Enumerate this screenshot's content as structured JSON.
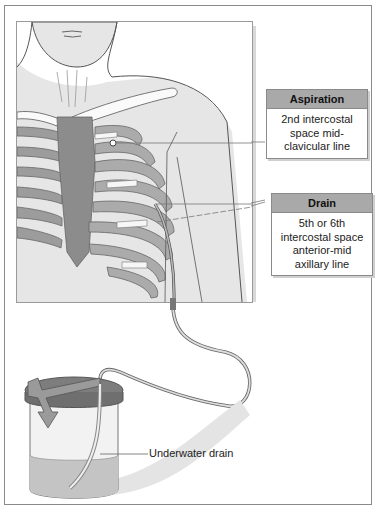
{
  "callouts": {
    "aspiration": {
      "title": "Aspiration",
      "lines": [
        "2nd intercostal",
        "space mid-",
        "clavicular line"
      ]
    },
    "drain": {
      "title": "Drain",
      "lines": [
        "5th or 6th",
        "intercostal space",
        "anterior-mid",
        "axillary line"
      ]
    }
  },
  "labels": {
    "underwater_drain": "Underwater drain"
  },
  "colors": {
    "callout_header": "#a9a9a9",
    "rib_fill": "#9c9c9c",
    "skin": "#e6e6e6",
    "bottle_water": "#c4c4c4"
  }
}
